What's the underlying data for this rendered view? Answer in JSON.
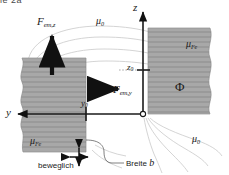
{
  "figure": {
    "kind": "magnetic-circuit-diagram",
    "language": "de",
    "cropped_header_text": "ie 2a",
    "colors": {
      "iron_fill": "#a8a8a8",
      "hatch_line": "#6e6e6e",
      "flux_line": "#c9c9c9",
      "axis": "#1a1a1a",
      "text": "#1a1a1a",
      "background": "#ffffff"
    }
  },
  "axes": {
    "z_label": "z",
    "y_label": "y",
    "origin_marker": "open-circle"
  },
  "ticks": {
    "z0": {
      "label": "z",
      "sub": "0"
    },
    "y0": {
      "label": "y",
      "sub": "0"
    }
  },
  "forces": [
    {
      "name": "F_em_z",
      "label": "F",
      "sub": "em,z",
      "direction": "up"
    },
    {
      "name": "F_em_y",
      "label": "F",
      "sub": "em,y",
      "direction": "right"
    }
  ],
  "materials": [
    {
      "name": "mu-0-top",
      "label": "μ",
      "sub": "0"
    },
    {
      "name": "mu-0-bottom",
      "label": "μ",
      "sub": "0"
    },
    {
      "name": "mu-Fe-right",
      "label": "μ",
      "sub": "Fe"
    },
    {
      "name": "mu-Fe-left",
      "label": "μ",
      "sub": "Fe"
    }
  ],
  "flux": {
    "symbol": "Φ"
  },
  "annotations": {
    "beweglich": "beweglich",
    "breite": "Breite",
    "breite_sym": "b"
  }
}
